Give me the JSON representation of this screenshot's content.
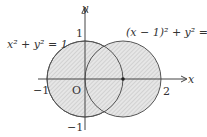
{
  "diagram": {
    "axis_labels": {
      "x": "x",
      "y": "y"
    },
    "origin_label": "O",
    "tick_labels": {
      "x_neg1": "−1",
      "x_2": "2",
      "y_1": "1",
      "y_neg1": "−1"
    },
    "circle1": {
      "equation_left": "x",
      "equation": "x² + y² = 1",
      "center": [
        0,
        0
      ],
      "radius": 1
    },
    "circle2": {
      "equation": "(x − 1)² + y² = 1",
      "center": [
        1,
        0
      ],
      "radius": 1
    },
    "marked_point": [
      1,
      0
    ],
    "colors": {
      "stroke": "#555555",
      "fill_hatch": "#cfcfcf",
      "background": "#ffffff"
    }
  }
}
